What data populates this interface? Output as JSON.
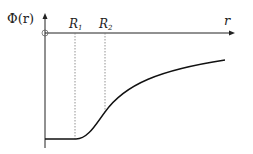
{
  "diagram": {
    "y_label": "Φ(r)",
    "x_label": "r",
    "markers": [
      {
        "label_main": "R",
        "label_sub": "1"
      },
      {
        "label_main": "R",
        "label_sub": "2"
      }
    ],
    "colors": {
      "axis": "#222222",
      "curve": "#111111",
      "guide": "#777777"
    }
  }
}
